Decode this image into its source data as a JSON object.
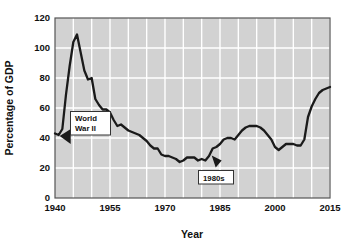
{
  "chart_data": {
    "type": "line",
    "title": "",
    "subtitle": "",
    "xlabel": "Year",
    "ylabel": "Percentage of GDP",
    "xlim": [
      1940,
      2015
    ],
    "ylim": [
      0,
      120
    ],
    "grid": true,
    "legend_position": "none",
    "x_ticks": [
      "1940",
      "1955",
      "1970",
      "1985",
      "2000",
      "2015"
    ],
    "x_tick_values": [
      1940,
      1955,
      1970,
      1985,
      2000,
      2015
    ],
    "y_ticks": [
      "0",
      "20",
      "40",
      "60",
      "80",
      "100",
      "120"
    ],
    "y_tick_values": [
      0,
      20,
      40,
      60,
      80,
      100,
      120
    ],
    "gridline_x_step": 5,
    "gridline_y_step": 20,
    "series": [
      {
        "name": "Federal debt held by the public as a percentage of GDP",
        "color": "#1a1a1a",
        "x": [
          1940,
          1941,
          1942,
          1943,
          1944,
          1945,
          1946,
          1947,
          1948,
          1949,
          1950,
          1951,
          1952,
          1953,
          1954,
          1955,
          1956,
          1957,
          1958,
          1959,
          1960,
          1961,
          1962,
          1963,
          1964,
          1965,
          1966,
          1967,
          1968,
          1969,
          1970,
          1971,
          1972,
          1973,
          1974,
          1975,
          1976,
          1977,
          1978,
          1979,
          1980,
          1981,
          1982,
          1983,
          1984,
          1985,
          1986,
          1987,
          1988,
          1989,
          1990,
          1991,
          1992,
          1993,
          1994,
          1995,
          1996,
          1997,
          1998,
          1999,
          2000,
          2001,
          2002,
          2003,
          2004,
          2005,
          2006,
          2007,
          2008,
          2009,
          2010,
          2011,
          2012,
          2013,
          2014,
          2015
        ],
        "values": [
          43,
          42,
          46,
          69,
          88,
          104,
          109,
          97,
          85,
          79,
          80,
          66,
          62,
          59,
          59,
          57,
          52,
          48,
          49,
          47,
          45,
          44,
          43,
          42,
          40,
          38,
          35,
          33,
          33,
          29,
          28,
          28,
          27,
          26,
          24,
          25,
          27,
          27,
          27,
          25,
          26,
          25,
          28,
          33,
          34,
          36,
          39,
          40,
          40,
          39,
          42,
          45,
          47,
          48,
          48,
          48,
          47,
          45,
          42,
          39,
          34,
          32,
          34,
          36,
          36,
          36,
          35,
          35,
          39,
          54,
          61,
          66,
          70,
          72,
          73,
          74
        ]
      }
    ],
    "annotations": [
      {
        "id": "world-war-ii",
        "label_line_1": "World",
        "label_line_2": "War II",
        "points_to_year": 1941,
        "points_to_value": 42
      },
      {
        "id": "nineteen-eighties",
        "label_line_1": "1980s",
        "label_line_2": "",
        "points_to_year": 1983,
        "points_to_value": 29
      }
    ],
    "colors": {
      "plot_background": "#d2d2d2",
      "gridline": "#ffffff",
      "line": "#1a1a1a",
      "border": "#555555",
      "text": "#111111",
      "annotation_box_fill": "#ffffff",
      "annotation_box_border": "#333333",
      "page_background": "#ffffff"
    }
  }
}
